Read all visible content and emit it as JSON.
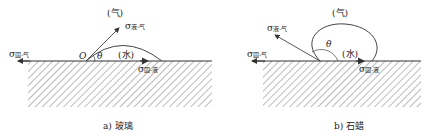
{
  "panels": [
    {
      "id": "a",
      "caption": "a) 玻璃",
      "gas_label": "(气)",
      "liquid_label": "(水)",
      "origin_label": "O",
      "angle_label": "θ",
      "sigma_lg": {
        "symbol": "σ",
        "sub": "液-气"
      },
      "sigma_sg": {
        "symbol": "σ",
        "sub": "固-气"
      },
      "sigma_sl": {
        "symbol": "σ",
        "sub": "固-液"
      }
    },
    {
      "id": "b",
      "caption": "b) 石蜡",
      "gas_label": "(气)",
      "liquid_label": "(水)",
      "angle_label": "θ",
      "sigma_lg": {
        "symbol": "σ",
        "sub": "液-气"
      },
      "sigma_sg": {
        "symbol": "σ",
        "sub": "固-气"
      },
      "sigma_sl": {
        "symbol": "σ",
        "sub": "固-液"
      }
    }
  ]
}
